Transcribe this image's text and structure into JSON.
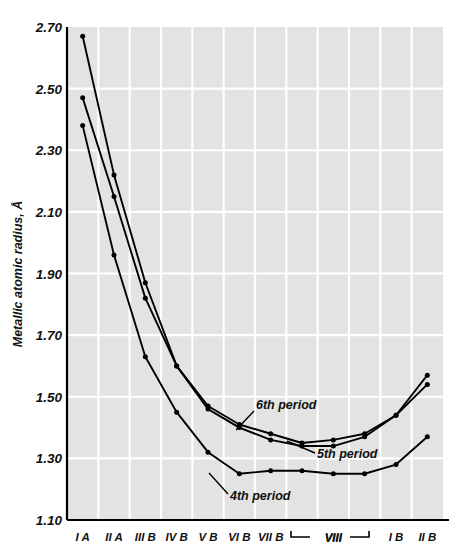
{
  "chart_data": {
    "type": "line",
    "title": "",
    "xlabel": "",
    "ylabel": "Metallic atomic radius, Å",
    "categories": [
      "I A",
      "II A",
      "III B",
      "IV B",
      "V B",
      "VI B",
      "VII B",
      "VIII",
      "VIII",
      "VIII",
      "I B",
      "II B"
    ],
    "xtick_labels": [
      "I A",
      "II A",
      "III B",
      "IV B",
      "V B",
      "VI B",
      "VII B",
      "VIII",
      "I B",
      "II B"
    ],
    "ytick_labels": [
      "2.70",
      "2.50",
      "2.30",
      "2.10",
      "1.90",
      "1.70",
      "1.50",
      "1.30",
      "1.10"
    ],
    "ytick_values": [
      2.7,
      2.5,
      2.3,
      2.1,
      1.9,
      1.7,
      1.5,
      1.3,
      1.1
    ],
    "ylim": [
      1.1,
      2.7
    ],
    "grid": true,
    "legend_position": "inline-annotations",
    "series": [
      {
        "name": "6th period",
        "values": [
          2.67,
          2.22,
          1.87,
          1.6,
          1.47,
          1.41,
          1.38,
          1.35,
          1.36,
          1.38,
          1.44,
          1.57
        ]
      },
      {
        "name": "5th period",
        "values": [
          2.47,
          2.15,
          1.82,
          1.6,
          1.46,
          1.4,
          1.36,
          1.34,
          1.34,
          1.37,
          1.44,
          1.54
        ]
      },
      {
        "name": "4th period",
        "values": [
          2.38,
          1.96,
          1.63,
          1.45,
          1.32,
          1.25,
          1.26,
          1.26,
          1.25,
          1.25,
          1.28,
          1.37
        ]
      }
    ],
    "annotations": [
      {
        "text": "6th period",
        "series": "6th period"
      },
      {
        "text": "5th period",
        "series": "5th period"
      },
      {
        "text": "4th period",
        "series": "4th period"
      }
    ],
    "group_bracket": {
      "label": "VIII",
      "spans": [
        "VIII",
        "VIII",
        "VIII"
      ]
    },
    "colors": {
      "plot_background": "#e3e3e3",
      "gridline": "#ffffff",
      "axis": "#000000",
      "line": "#000000",
      "figure_background": "#ffffff"
    }
  }
}
